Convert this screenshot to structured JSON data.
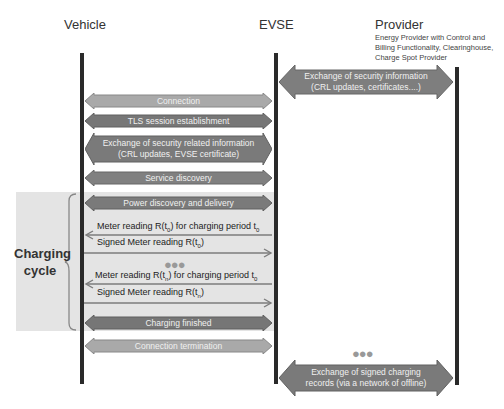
{
  "actors": {
    "vehicle": "Vehicle",
    "evse": "EVSE",
    "provider": "Provider",
    "provider_description": [
      "Energy Provider with Control and",
      "Billing Functionality, Clearinghouse,",
      "Charge Spot Provider"
    ]
  },
  "colors": {
    "light_arrow": "#a9a9a9",
    "medium_arrow": "#8a8a8a",
    "dark_arrow": "#767676",
    "lifeline": "#2a2a2a",
    "shade": "#e4e4e4",
    "thin_arrow": "#7c7c7c"
  },
  "arrows": {
    "provider_security": [
      "Exchange of security information",
      "(CRL updates, certificates....)"
    ],
    "connection": "Connection",
    "tls": "TLS session establishment",
    "security_related": [
      "Exchange of security related information",
      "(CRL updates, EVSE certificate)"
    ],
    "service_discovery": "Service discovery",
    "power_discovery": "Power discovery and delivery",
    "charging_finished": "Charging finished",
    "connection_termination": "Connection termination",
    "signed_records": [
      "Exchange of signed charging",
      "records (via a network of offline)"
    ]
  },
  "messages": {
    "meter_reading_1": {
      "prefix": "Meter reading R(t",
      "sub1": "0",
      "mid": ") for charging period t",
      "sub2": "0"
    },
    "signed_1": {
      "prefix": "Signed Meter reading R(t",
      "sub1": "0",
      "suffix": ")"
    },
    "meter_reading_n": {
      "prefix": "Meter reading R(t",
      "sub1": "n",
      "mid": ") for charging period t",
      "sub2": "0"
    },
    "signed_n": {
      "prefix": "Signed Meter reading R(t",
      "sub1": "n",
      "suffix": ")"
    }
  },
  "ellipsis": "●●●",
  "charging_cycle": [
    "Charging",
    "cycle"
  ]
}
